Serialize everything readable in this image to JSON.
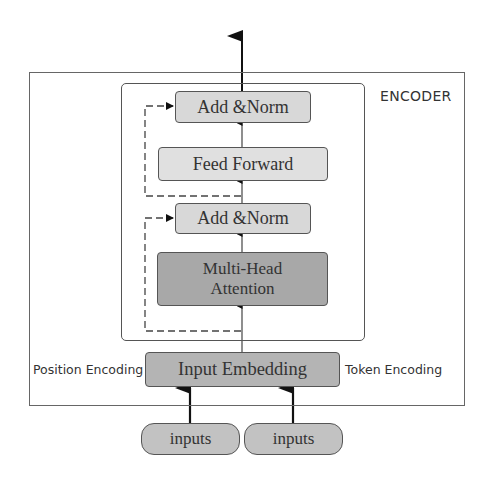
{
  "diagram": {
    "title": "ENCODER",
    "blocks": {
      "add_norm_top": "Add &Norm",
      "feed_forward": "Feed Forward",
      "add_norm_bottom": "Add &Norm",
      "multi_head_attention": "Multi-Head Attention",
      "input_embedding": "Input Embedding"
    },
    "side_labels": {
      "left": "Position Encoding",
      "right": "Token Encoding"
    },
    "inputs": [
      "inputs",
      "inputs"
    ],
    "colors": {
      "block_light": "#d8d8d8",
      "block_dark": "#a8a8a8",
      "input_pill": "#c2c2c2",
      "stroke": "#555555",
      "arrow": "#111111"
    }
  }
}
